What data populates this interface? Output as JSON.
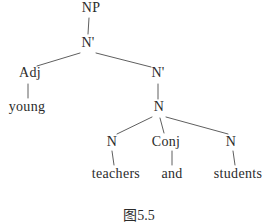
{
  "diagram": {
    "type": "syntax-tree",
    "caption": "图5.5",
    "colors": {
      "background": "#ffffff",
      "text": "#2b2b2b",
      "line": "#5f5f5f"
    },
    "nodes": {
      "np": "NP",
      "nbar1": "N'",
      "adj": "Adj",
      "nbar2": "N'",
      "young": "young",
      "n_top": "N",
      "n_left": "N",
      "conj": "Conj",
      "n_right": "N",
      "teachers": "teachers",
      "and": "and",
      "students": "students"
    },
    "edges": [
      "NP-N'",
      "N'-Adj",
      "N'-N'(right)",
      "Adj-young",
      "N'(right)-N",
      "N-N(left)",
      "N-Conj",
      "N-N(right)",
      "N(left)-teachers",
      "Conj-and",
      "N(right)-students"
    ]
  }
}
